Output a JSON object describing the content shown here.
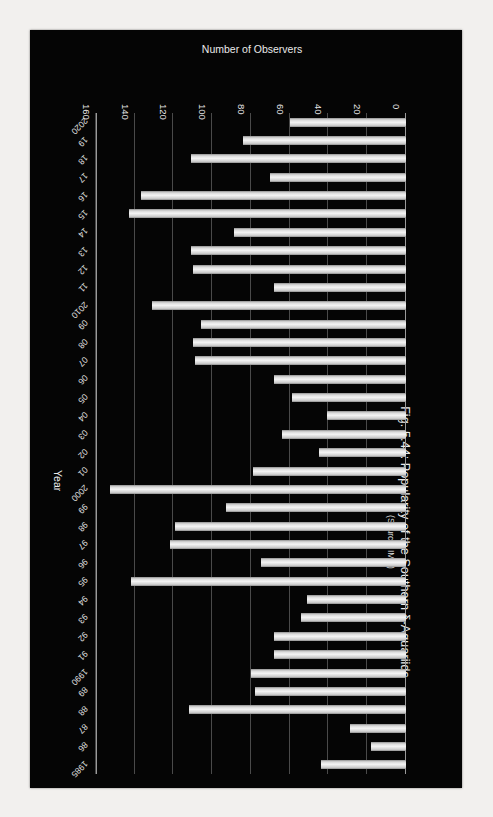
{
  "figure": {
    "title": "Fig. 5.44: Popularity of the Southern δ-Aquariids",
    "subtitle": "(Source: IMO)"
  },
  "chart_data": {
    "type": "bar",
    "orientation": "horizontal",
    "title": "Fig. 5.44: Popularity of the Southern δ-Aquariids",
    "subtitle": "(Source: IMO)",
    "xlabel": "Number of Observers",
    "ylabel": "Year",
    "xlim": [
      0,
      160
    ],
    "xticks": [
      0,
      20,
      40,
      60,
      80,
      100,
      120,
      140,
      160
    ],
    "grid": true,
    "legend": null,
    "categories": [
      "1985",
      "86",
      "87",
      "88",
      "89",
      "1990",
      "91",
      "92",
      "93",
      "94",
      "95",
      "96",
      "97",
      "98",
      "99",
      "2000",
      "01",
      "02",
      "03",
      "04",
      "05",
      "06",
      "07",
      "08",
      "09",
      "2010",
      "11",
      "12",
      "13",
      "14",
      "15",
      "16",
      "17",
      "18",
      "19",
      "2020"
    ],
    "values": [
      44,
      18,
      29,
      112,
      78,
      80,
      68,
      68,
      54,
      51,
      142,
      75,
      122,
      119,
      93,
      153,
      79,
      45,
      64,
      41,
      59,
      68,
      109,
      110,
      106,
      131,
      68,
      110,
      111,
      89,
      143,
      137,
      70,
      111,
      84,
      60
    ]
  }
}
